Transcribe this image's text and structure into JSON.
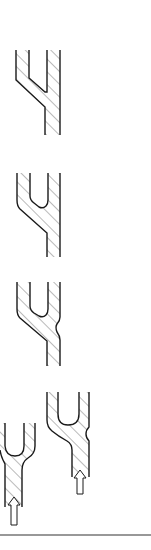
{
  "diagram": {
    "colors": {
      "stroke": "#1a1a1a",
      "hatch": "#555555",
      "background": "#ffffff",
      "baseline": "#333333"
    },
    "figures": [
      {
        "id": "fig-1",
        "shape": "sharp-cornered Y fork",
        "arrow": false
      },
      {
        "id": "fig-2",
        "shape": "Y fork with rounded inner crotch",
        "arrow": false
      },
      {
        "id": "fig-3",
        "shape": "Y fork with rounded crotch and outer bulge",
        "arrow": false
      },
      {
        "id": "fig-4a",
        "shape": "Y fork with upward flow arrow (left)",
        "arrow": true,
        "arrow_direction": "up"
      },
      {
        "id": "fig-4b",
        "shape": "Y fork with bulge and upward flow arrow (right)",
        "arrow": true,
        "arrow_direction": "up"
      }
    ],
    "baseline": true
  }
}
